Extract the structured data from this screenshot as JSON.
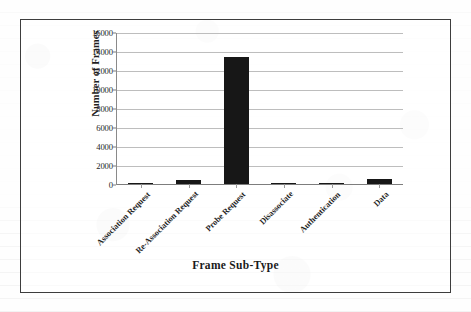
{
  "chart_data": {
    "type": "bar",
    "title": "",
    "xlabel": "Frame Sub-Type",
    "ylabel": "Number of Frames",
    "categories": [
      "Association Request",
      "Re-Association Request",
      "Probe Request",
      "Disassociate",
      "Authentication",
      "Data"
    ],
    "values": [
      60,
      450,
      13400,
      60,
      70,
      550
    ],
    "ylim": [
      0,
      16000
    ],
    "ytick_labels": [
      "0",
      "2000",
      "4000",
      "6000",
      "8000",
      "10000",
      "12000",
      "14000",
      "16000"
    ],
    "ytick_values": [
      0,
      2000,
      4000,
      6000,
      8000,
      10000,
      12000,
      14000,
      16000
    ],
    "grid": "horizontal",
    "legend": "none",
    "series": [
      {
        "name": "Number of Frames",
        "values": [
          60,
          450,
          13400,
          60,
          70,
          550
        ],
        "color": "#171717"
      }
    ]
  },
  "style": {
    "bar_color": "#171717",
    "gridline_color": "#bdbdbd",
    "axis_color": "#7d7d7d",
    "frame_border_color": "#3d3d3d",
    "page_background": "#fefefe"
  }
}
